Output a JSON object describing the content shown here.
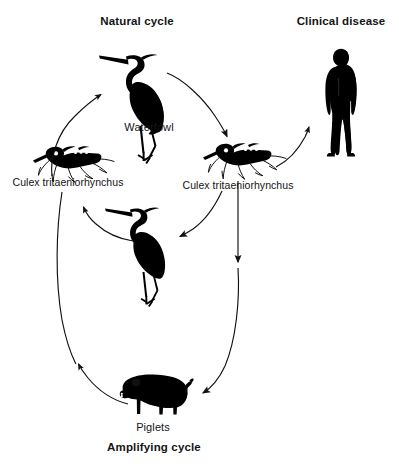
{
  "diagram": {
    "title_natural_cycle": "Natural cycle",
    "title_clinical_disease": "Clinical disease",
    "title_amplifying_cycle": "Amplifying cycle",
    "labels": {
      "waterfowl": "Waterfowl",
      "vector_left": "Culex tritaeniorhynchus",
      "vector_right": "Culex tritaeniorhynchus",
      "piglets": "Piglets"
    },
    "colors": {
      "silhouette": "#000000",
      "arrow": "#1a1a1a",
      "text": "#141414",
      "background": "#ffffff"
    },
    "nodes": [
      {
        "id": "waterfowl-top",
        "icon": "heron-silhouette-icon",
        "label": "Waterfowl",
        "x": 133,
        "y": 85
      },
      {
        "id": "vector-left",
        "icon": "mosquito-silhouette-icon",
        "label": "Culex tritaeniorhynchus",
        "x": 67,
        "y": 158
      },
      {
        "id": "vector-right",
        "icon": "mosquito-silhouette-icon",
        "label": "Culex tritaeniorhynchus",
        "x": 237,
        "y": 155
      },
      {
        "id": "waterfowl-mid",
        "icon": "heron-silhouette-icon",
        "label": "",
        "x": 138,
        "y": 238
      },
      {
        "id": "human",
        "icon": "human-silhouette-icon",
        "label": "Clinical disease",
        "x": 341,
        "y": 103
      },
      {
        "id": "piglets",
        "icon": "pig-silhouette-icon",
        "label": "Piglets",
        "x": 155,
        "y": 396
      }
    ],
    "arrows": [
      {
        "id": "vector-left-to-waterfowl-top",
        "from": "vector-left",
        "to": "waterfowl-top"
      },
      {
        "id": "waterfowl-top-to-vector-right",
        "from": "waterfowl-top",
        "to": "vector-right"
      },
      {
        "id": "vector-right-to-human",
        "from": "vector-right",
        "to": "human"
      },
      {
        "id": "vector-right-to-waterfowl-mid",
        "from": "vector-right",
        "to": "waterfowl-mid"
      },
      {
        "id": "waterfowl-mid-to-vector-left",
        "from": "waterfowl-mid",
        "to": "vector-left"
      },
      {
        "id": "vector-right-to-piglets",
        "from": "vector-right",
        "to": "piglets"
      },
      {
        "id": "piglets-to-vector-left",
        "from": "piglets",
        "to": "vector-left"
      }
    ]
  }
}
